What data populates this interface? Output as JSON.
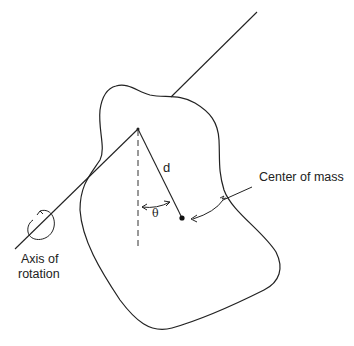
{
  "diagram": {
    "type": "physical pendulum",
    "labels": {
      "distance": "d",
      "angle": "θ",
      "center_of_mass": "Center of mass",
      "axis_line1": "Axis of",
      "axis_line2": "rotation"
    },
    "elements": [
      "irregular rigid body outline",
      "axis of rotation line passing through pivot",
      "dashed vertical reference line from pivot",
      "line from pivot to center of mass (length d)",
      "angle arc θ between vertical and d",
      "center of mass dot",
      "leader arrow from label to center of mass",
      "curved rotation arrow around axis"
    ],
    "colors": {
      "stroke": "#222222",
      "background": "#ffffff"
    }
  }
}
